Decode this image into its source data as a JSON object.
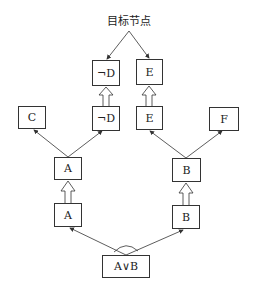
{
  "title": "目标节点",
  "nodes": {
    "notD_top": "¬D",
    "E_top": "E",
    "C": "C",
    "notD_mid": "¬D",
    "E_mid": "E",
    "F": "F",
    "A_upper": "A",
    "B_upper": "B",
    "A_lower": "A",
    "B_lower": "B",
    "AorB": "A∨B"
  },
  "colors": {
    "stroke": "#333333",
    "background": "#ffffff"
  }
}
